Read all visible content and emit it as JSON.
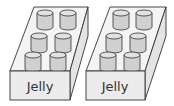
{
  "diagram": {
    "title": "",
    "boxes": [
      {
        "label": "Jelly",
        "jar_count": 6,
        "rows": 3,
        "cols": 2
      },
      {
        "label": "Jelly",
        "jar_count": 6,
        "rows": 3,
        "cols": 2
      }
    ],
    "colors": {
      "outline": "#333333",
      "box_face": "#ececec",
      "jar_body": "#d0d0d0",
      "jar_top": "#e0e0e0"
    }
  }
}
